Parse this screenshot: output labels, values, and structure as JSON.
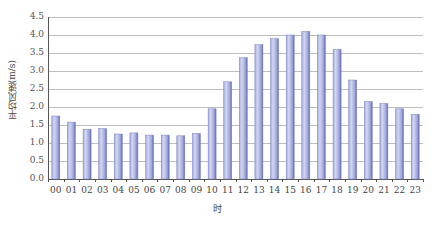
{
  "chart_data": {
    "type": "bar",
    "title": "",
    "xlabel": "时",
    "ylabel": "平均风速(m/s)",
    "ylim": [
      0,
      4.5
    ],
    "yticks": [
      "0.0",
      "0.5",
      "1.0",
      "1.5",
      "2.0",
      "2.5",
      "3.0",
      "3.5",
      "4.0",
      "4.5"
    ],
    "grid": true,
    "legend": null,
    "categories": [
      "00",
      "01",
      "02",
      "03",
      "04",
      "05",
      "06",
      "07",
      "08",
      "09",
      "10",
      "11",
      "12",
      "13",
      "14",
      "15",
      "16",
      "17",
      "18",
      "19",
      "20",
      "21",
      "22",
      "23"
    ],
    "values": [
      1.75,
      1.58,
      1.38,
      1.4,
      1.25,
      1.28,
      1.22,
      1.22,
      1.2,
      1.27,
      1.95,
      2.7,
      3.37,
      3.73,
      3.9,
      4.0,
      4.1,
      4.0,
      3.6,
      2.75,
      2.15,
      2.1,
      1.95,
      1.8
    ],
    "colors": {
      "bar_light": "#d4d8f0",
      "bar_mid": "#9fa6dc",
      "bar_dark": "#5d66b3",
      "grid": "#bdbdbd",
      "axis": "#555555"
    }
  }
}
